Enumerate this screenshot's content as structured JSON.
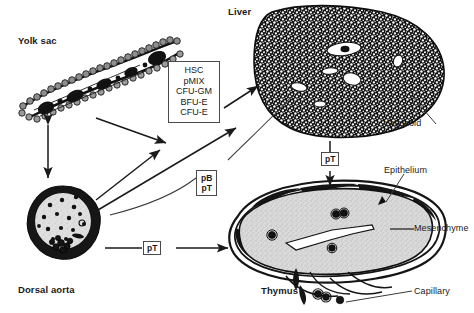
{
  "figure": {
    "type": "biological-schematic",
    "title_caption": ""
  },
  "organs": {
    "yolk_sac": {
      "label": "Yolk sac"
    },
    "liver": {
      "label": "Liver"
    },
    "dorsal_aorta": {
      "label": "Dorsal aorta"
    },
    "thymus": {
      "label": "Thymus"
    }
  },
  "progenitor_box": {
    "items": [
      "HSC",
      "pMIX",
      "CFU-GM",
      "BFU-E",
      "CFU-E"
    ]
  },
  "tags": {
    "liver_to_thymus": [
      "pT"
    ],
    "aorta_to_thymus": [
      "pT"
    ],
    "curved_to_thymus": [
      "pB",
      "pT"
    ]
  },
  "annotations": {
    "sinusoid": "Sinusoid",
    "epithelium": "Epithelium",
    "mesenchyme": "Mesenchyme",
    "capillary": "Capillary"
  },
  "colors": {
    "ink": "#1a1a1a",
    "line": "#3a3a3a",
    "box_border": "#4a4a4a",
    "thymus_fill": "#d9d9d9",
    "aorta_fill": "#d6d6d6",
    "paper": "#ffffff"
  }
}
